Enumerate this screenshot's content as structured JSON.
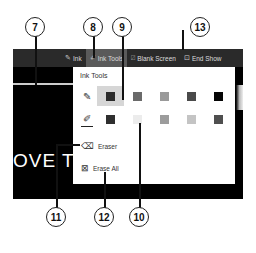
{
  "callouts": [
    {
      "id": "7",
      "label": "7"
    },
    {
      "id": "8",
      "label": "8"
    },
    {
      "id": "9",
      "label": "9"
    },
    {
      "id": "13",
      "label": "13"
    },
    {
      "id": "11",
      "label": "11"
    },
    {
      "id": "12",
      "label": "12"
    },
    {
      "id": "10",
      "label": "10"
    }
  ],
  "toolbar": {
    "ink": {
      "label": "Ink",
      "icon": "pen-icon"
    },
    "ink_tools": {
      "label": "Ink Tools",
      "icon": "ink-tools-icon"
    },
    "blank_screen": {
      "label": "Blank Screen",
      "icon": "blank-screen-icon"
    },
    "end_show": {
      "label": "End Show",
      "icon": "end-show-icon"
    }
  },
  "slide": {
    "text": "OVE T"
  },
  "ink_menu": {
    "title": "Ink Tools",
    "pen_row": {
      "icon": "pen-icon",
      "colors": [
        "#2b2b2b",
        "#6a6a6a",
        "#9a9a9a",
        "#4a4a4a",
        "#050505"
      ],
      "selected_index": 0
    },
    "highlighter_row": {
      "icon": "highlighter-icon",
      "colors": [
        "#2f2f2f",
        "#ececec",
        "#9c9c9c",
        "#c4c4c4",
        "#4f4f4f"
      ]
    },
    "eraser": {
      "label": "Eraser",
      "icon": "eraser-icon"
    },
    "erase_all": {
      "label": "Erase All",
      "icon": "erase-all-icon"
    }
  }
}
